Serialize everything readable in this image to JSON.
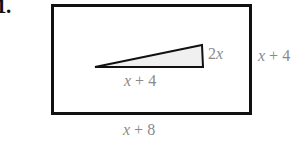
{
  "problem": {
    "number": "1."
  },
  "figure": {
    "type": "geometry-diagram",
    "rectangle": {
      "x": 51,
      "y": 4,
      "width": 201,
      "height": 111,
      "stroke": "#111111",
      "stroke_width": 3,
      "fill": "#ffffff"
    },
    "triangle": {
      "points": "95,67 203,67 202,45",
      "stroke": "#111111",
      "stroke_width": 2,
      "fill": "#f0f0f0"
    }
  },
  "labels": {
    "triangle_height": {
      "coefficient": "2",
      "variable": "x",
      "text": "2x"
    },
    "triangle_base": {
      "variable": "x",
      "operator": "+",
      "constant": "4",
      "text": "x + 4"
    },
    "rectangle_height": {
      "variable": "x",
      "operator": "+",
      "constant": "4",
      "text": "x + 4"
    },
    "rectangle_width": {
      "variable": "x",
      "operator": "+",
      "constant": "8",
      "text": "x + 8"
    }
  },
  "colors": {
    "ink": "#111111",
    "label_gray": "#8a8a8a",
    "shade": "#f0f0f0",
    "page_background": "#ffffff"
  }
}
